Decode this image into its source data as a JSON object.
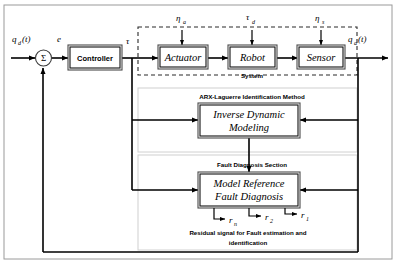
{
  "diagram": {
    "signals": {
      "reference_input": "q",
      "reference_input_sub": "d",
      "reference_input_arg": "(t)",
      "error": "e",
      "torque": "τ",
      "output": "q",
      "output_sub": "a",
      "output_arg": "(t)",
      "actuator_noise": "η",
      "actuator_noise_sub": "a",
      "torque_disturbance": "τ",
      "torque_disturbance_sub": "d",
      "sensor_noise": "η",
      "sensor_noise_sub": "s",
      "sum_symbol": "Σ"
    },
    "blocks": {
      "controller": "Controller",
      "actuator": "Actuator",
      "robot": "Robot",
      "sensor": "Sensor",
      "inverse_dynamic_line1": "Inverse Dynamic",
      "inverse_dynamic_line2": "Modeling",
      "model_reference_line1": "Model  Reference",
      "model_reference_line2": "Fault Diagnosis"
    },
    "sections": {
      "system": "System",
      "identification": "ARX-Laguerre Identification Method",
      "fault_diagnosis": "Fault Diagnosis Section"
    },
    "residuals": [
      {
        "symbol": "r",
        "sub": "n"
      },
      {
        "symbol": "r",
        "sub": "2"
      },
      {
        "symbol": "r",
        "sub": "1"
      }
    ],
    "caption": {
      "line1": "Residual signal for Fault estimation and",
      "line2": "identification"
    },
    "colors": {
      "stroke": "#000000",
      "block_border": "#4a4a4a",
      "dashed_border": "#2b2b2b",
      "light_border": "#d0d0d0",
      "background": "#ffffff"
    }
  }
}
